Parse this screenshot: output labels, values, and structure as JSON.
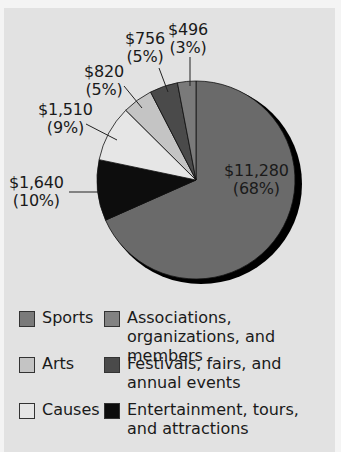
{
  "chart_data": {
    "type": "pie",
    "title": "",
    "slices": [
      {
        "name": "Associations, organizations, and members",
        "value": 11280,
        "label": "$11,280",
        "pct": "(68%)",
        "color": "#6a6a6a"
      },
      {
        "name": "Entertainment, tours, and attractions",
        "value": 1640,
        "label": "$1,640",
        "pct": "(10%)",
        "color": "#0d0d0d"
      },
      {
        "name": "Causes",
        "value": 1510,
        "label": "$1,510",
        "pct": "(9%)",
        "color": "#e6e6e6"
      },
      {
        "name": "Arts",
        "value": 820,
        "label": "$820",
        "pct": "(5%)",
        "color": "#c4c4c4"
      },
      {
        "name": "Festivals, fairs, and annual events",
        "value": 756,
        "label": "$756",
        "pct": "(5%)",
        "color": "#4a4a4a"
      },
      {
        "name": "Sports",
        "value": 496,
        "label": "$496",
        "pct": "(3%)",
        "color": "#7a7a7a"
      }
    ],
    "legend": [
      {
        "label": "Sports",
        "color": "#7a7a7a"
      },
      {
        "label": "Associations, organizations, and members",
        "color": "#828282"
      },
      {
        "label": "Arts",
        "color": "#c4c4c4"
      },
      {
        "label": "Festivals, fairs, and annual events",
        "color": "#4a4a4a"
      },
      {
        "label": "Causes",
        "color": "#e6e6e6"
      },
      {
        "label": "Entertainment, tours, and attractions",
        "color": "#0d0d0d"
      }
    ],
    "legend_position": "bottom"
  }
}
